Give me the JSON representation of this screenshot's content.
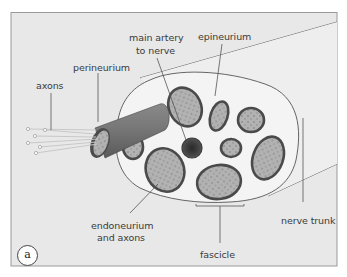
{
  "figure": {
    "panel_label": "a",
    "labels": {
      "axons": "axons",
      "perineurium": "perineurium",
      "main_artery_line1": "main artery",
      "main_artery_line2": "to nerve",
      "epineurium": "epineurium",
      "endoneurium_line1": "endoneurium",
      "endoneurium_line2": "and axons",
      "fascicle": "fascicle",
      "nerve_trunk": "nerve trunk"
    },
    "colors": {
      "background": "#e8e8e8",
      "frame": "#9a9a9a",
      "cross_section": "#f4f4f4",
      "fascicle_fill": "#b4b4b4",
      "fascicle_border": "#4a4a4a",
      "artery": "#3a3a3a",
      "label_text": "#3a3a3a"
    }
  }
}
